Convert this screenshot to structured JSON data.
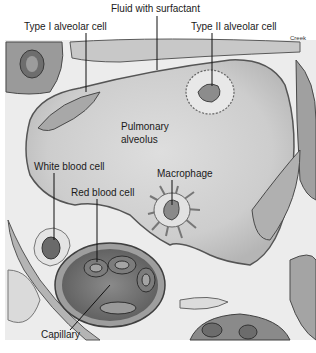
{
  "figure": {
    "credit": "Creek",
    "colors": {
      "background": "#ffffff",
      "tissue_light": "#e6e6e6",
      "tissue_mid": "#bdbdbd",
      "tissue_dark": "#7a7a7a",
      "outline": "#4a4a4a",
      "alveolus_fill": "#cfcfcf",
      "leader_line": "#111111"
    },
    "labels": [
      {
        "id": "fluid",
        "text": "Fluid with surfactant",
        "x": 111,
        "y": 3
      },
      {
        "id": "type1",
        "text": "Type I alveolar cell",
        "x": 24,
        "y": 21
      },
      {
        "id": "type2",
        "text": "Type II alveolar cell",
        "x": 191,
        "y": 21
      },
      {
        "id": "alveolus_1",
        "text": "Pulmonary",
        "x": 121,
        "y": 121
      },
      {
        "id": "alveolus_2",
        "text": "alveolus",
        "x": 121,
        "y": 134
      },
      {
        "id": "macrophage",
        "text": "Macrophage",
        "x": 157,
        "y": 168
      },
      {
        "id": "wbc",
        "text": "White blood cell",
        "x": 34,
        "y": 161
      },
      {
        "id": "rbc",
        "text": "Red blood cell",
        "x": 71,
        "y": 187
      },
      {
        "id": "capillary",
        "text": "Capillary",
        "x": 41,
        "y": 329
      }
    ]
  }
}
